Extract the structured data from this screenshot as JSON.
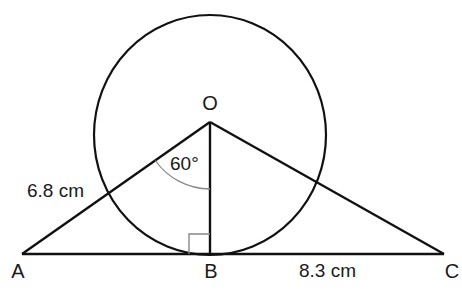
{
  "diagram": {
    "points": {
      "O": {
        "label": "O",
        "x": 210,
        "y": 122
      },
      "A": {
        "label": "A",
        "x": 22,
        "y": 254
      },
      "B": {
        "label": "B",
        "x": 210,
        "y": 254
      },
      "C": {
        "label": "C",
        "x": 444,
        "y": 254
      }
    },
    "circle": {
      "cx": 210,
      "cy": 135,
      "rx": 116,
      "ry": 120
    },
    "angle_label": "60°",
    "measurements": {
      "OA": "6.8 cm",
      "BC": "8.3 cm"
    },
    "colors": {
      "line": "#111111",
      "angle_arc": "#888888",
      "right_angle": "#888888"
    }
  }
}
